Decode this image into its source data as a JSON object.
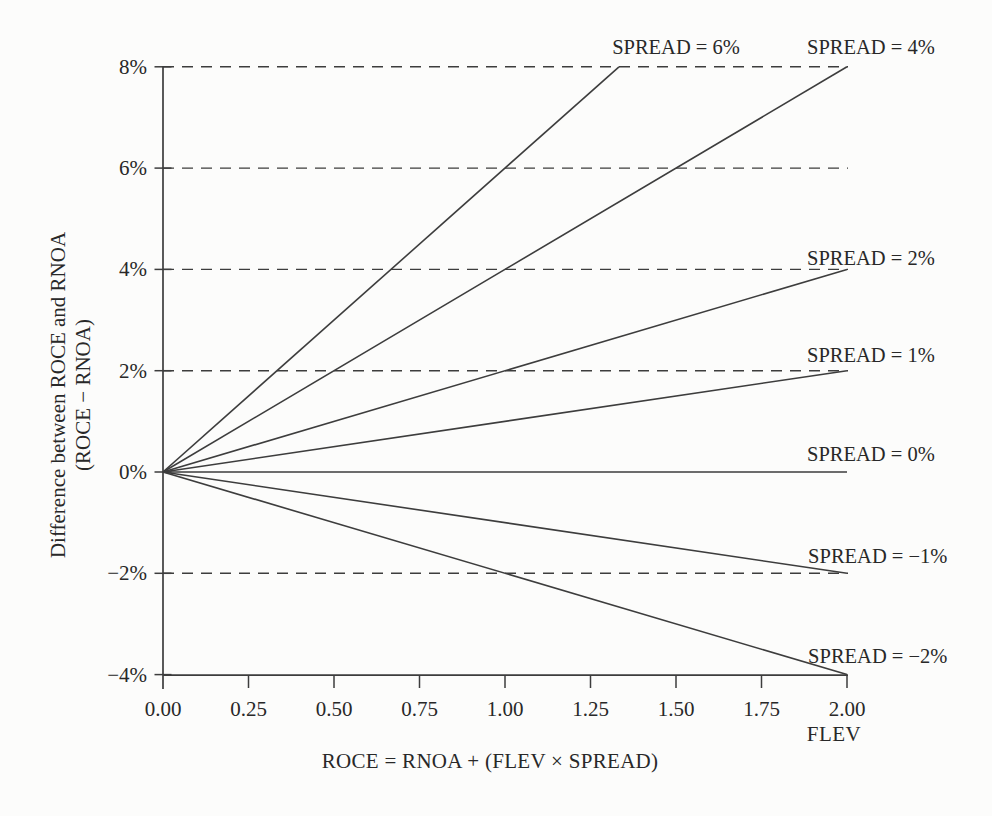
{
  "page": {
    "background_color": "#fcfcfb",
    "ink_color": "#282828",
    "line_color": "#3d3d3d"
  },
  "chart_data": {
    "type": "line",
    "title": "",
    "xlabel": "FLEV",
    "ylabel_lines": [
      "Difference between ROCE and RNOA",
      "(ROCE − RNOA)"
    ],
    "caption_formula": "ROCE = RNOA + (FLEV × SPREAD)",
    "xlim": [
      0,
      2
    ],
    "ylim_pct": [
      -4,
      8
    ],
    "grid_style": "dashed-horizontal",
    "gridlines_pct": [
      8,
      6,
      4,
      2,
      -2
    ],
    "legend_position": "labels-at-line-ends",
    "x_ticks": [
      {
        "value": 0.0,
        "label": "0.00"
      },
      {
        "value": 0.25,
        "label": "0.25"
      },
      {
        "value": 0.5,
        "label": "0.50"
      },
      {
        "value": 0.75,
        "label": "0.75"
      },
      {
        "value": 1.0,
        "label": "1.00"
      },
      {
        "value": 1.25,
        "label": "1.25"
      },
      {
        "value": 1.5,
        "label": "1.50"
      },
      {
        "value": 1.75,
        "label": "1.75"
      },
      {
        "value": 2.0,
        "label": "2.00"
      }
    ],
    "y_ticks": [
      {
        "value_pct": 8,
        "label": "8%"
      },
      {
        "value_pct": 6,
        "label": "6%"
      },
      {
        "value_pct": 4,
        "label": "4%"
      },
      {
        "value_pct": 2,
        "label": "2%"
      },
      {
        "value_pct": 0,
        "label": "0%"
      },
      {
        "value_pct": -2,
        "label": "−2%"
      },
      {
        "value_pct": -4,
        "label": "−4%"
      }
    ],
    "series": [
      {
        "name": "SPREAD = 6%",
        "spread_pct": 6,
        "x": [
          0,
          1.3333
        ],
        "y_pct": [
          0,
          8
        ],
        "label": "SPREAD = 6%",
        "label_pos": {
          "x": 1.5,
          "y_pct": 8.26
        }
      },
      {
        "name": "SPREAD = 4%",
        "spread_pct": 4,
        "x": [
          0,
          2
        ],
        "y_pct": [
          0,
          8
        ],
        "label": "SPREAD = 4%",
        "label_pos": {
          "x": 2.07,
          "y_pct": 8.26
        }
      },
      {
        "name": "SPREAD = 2%",
        "spread_pct": 2,
        "x": [
          0,
          2
        ],
        "y_pct": [
          0,
          4
        ],
        "label": "SPREAD = 2%",
        "label_pos": {
          "x": 2.07,
          "y_pct": 4.09
        }
      },
      {
        "name": "SPREAD = 1%",
        "spread_pct": 1,
        "x": [
          0,
          2
        ],
        "y_pct": [
          0,
          2
        ],
        "label": "SPREAD = 1%",
        "label_pos": {
          "x": 2.07,
          "y_pct": 2.18
        }
      },
      {
        "name": "SPREAD = 0%",
        "spread_pct": 0,
        "x": [
          0,
          2
        ],
        "y_pct": [
          0,
          0
        ],
        "label": "SPREAD = 0%",
        "label_pos": {
          "x": 2.07,
          "y_pct": 0.21
        }
      },
      {
        "name": "SPREAD = −1%",
        "spread_pct": -1,
        "x": [
          0,
          2
        ],
        "y_pct": [
          0,
          -2
        ],
        "label": "SPREAD = −1%",
        "label_pos": {
          "x": 2.09,
          "y_pct": -1.8
        }
      },
      {
        "name": "SPREAD = −2%",
        "spread_pct": -2,
        "x": [
          0,
          2
        ],
        "y_pct": [
          0,
          -4
        ],
        "label": "SPREAD = −2%",
        "label_pos": {
          "x": 2.09,
          "y_pct": -3.77
        }
      }
    ]
  }
}
